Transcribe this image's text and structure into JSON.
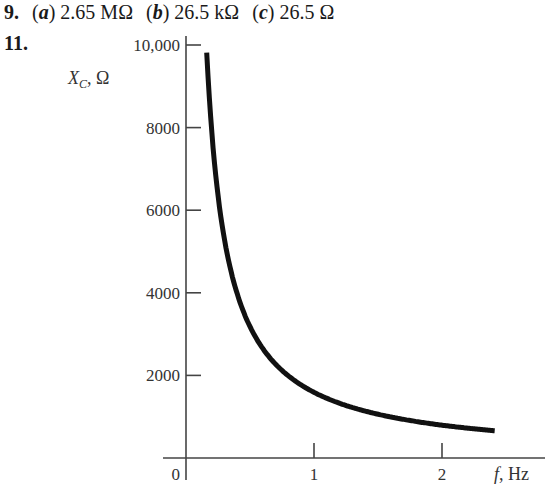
{
  "problem9": {
    "number": "9.",
    "parts": [
      {
        "label": "a",
        "value": "2.65 MΩ"
      },
      {
        "label": "b",
        "value": "26.5 kΩ"
      },
      {
        "label": "c",
        "value": "26.5 Ω"
      }
    ]
  },
  "problem11": {
    "number": "11."
  },
  "chart_data": {
    "type": "line",
    "title": "",
    "xlabel": "f, Hz",
    "ylabel": "X_C, Ω",
    "x_ticks": [
      "0",
      "1",
      "2"
    ],
    "y_ticks": [
      "2000",
      "4000",
      "6000",
      "8000",
      "10,000"
    ],
    "xlim": [
      0,
      2.6
    ],
    "ylim": [
      0,
      10000
    ],
    "grid": false,
    "legend": null,
    "series": [
      {
        "name": "X_C = 1/(2πfC)",
        "x": [
          0.16,
          0.2,
          0.25,
          0.3,
          0.4,
          0.5,
          0.6,
          0.8,
          1.0,
          1.2,
          1.5,
          1.8,
          2.0,
          2.2,
          2.4
        ],
        "y": [
          9950,
          7960,
          6370,
          5310,
          3980,
          3180,
          2650,
          1990,
          1590,
          1330,
          1060,
          880,
          800,
          720,
          660
        ]
      }
    ]
  }
}
